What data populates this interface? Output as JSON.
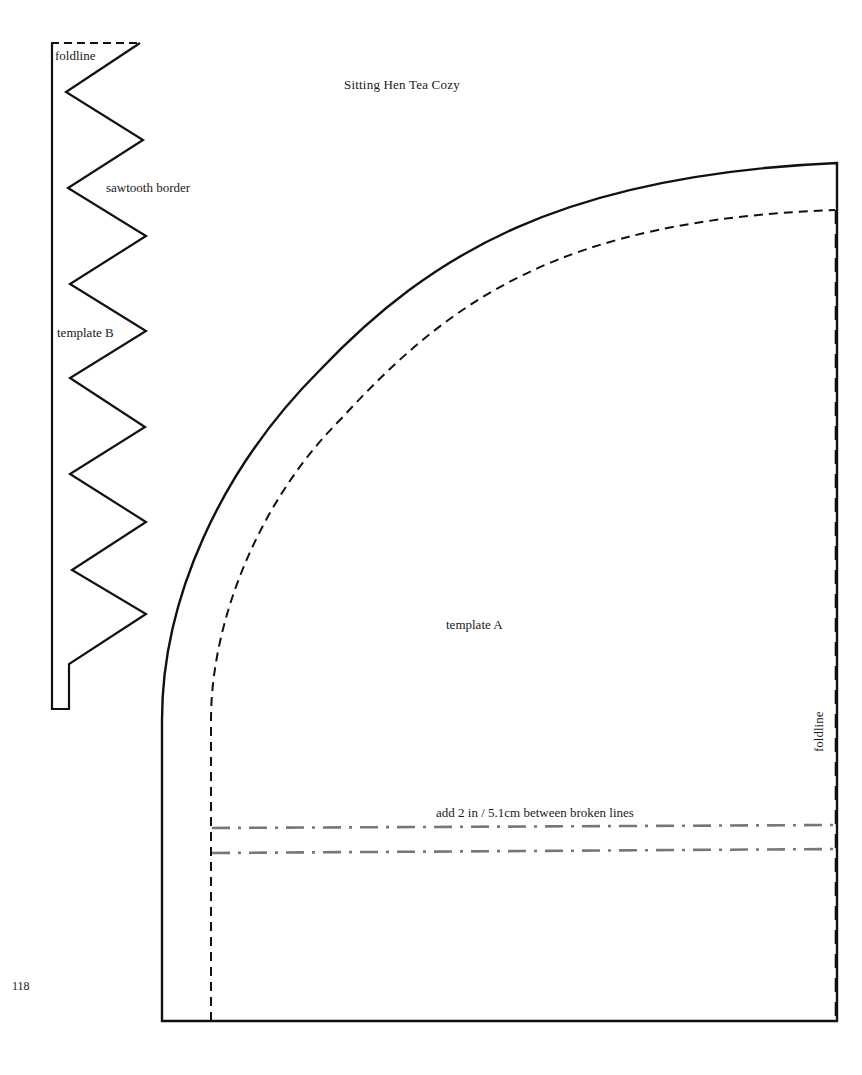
{
  "page": {
    "title": "Sitting Hen Tea Cozy",
    "page_number": "118"
  },
  "template_b": {
    "name": "template B",
    "border_label": "sawtooth border",
    "foldline_label": "foldline"
  },
  "template_a": {
    "name": "template A",
    "foldline_label": "foldline",
    "instruction": "add 2 in / 5.1cm between broken lines"
  },
  "colors": {
    "outline": "#111111",
    "broken_line": "#777777",
    "background": "#ffffff"
  }
}
